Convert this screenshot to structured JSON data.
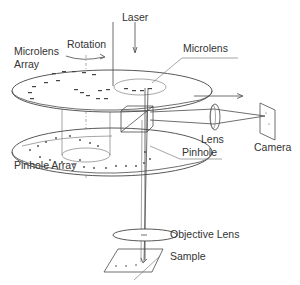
{
  "diagram": {
    "labels": {
      "laser": "Laser",
      "microlens_array": [
        "Microlens",
        "Array"
      ],
      "rotation": "Rotation",
      "microlens": "Microlens",
      "lens": "Lens",
      "pinhole": "Pinhole",
      "camera": "Camera",
      "pinhole_array": "Pinhole Array",
      "objective_lens": "Objective Lens",
      "sample": "Sample"
    },
    "components": [
      {
        "id": "laser",
        "label": "Laser",
        "type": "light-source"
      },
      {
        "id": "microlens-disk",
        "label": "Microlens Array",
        "type": "rotating-disk"
      },
      {
        "id": "beam-splitter",
        "label": "",
        "type": "dichroic-cube"
      },
      {
        "id": "pinhole-disk",
        "label": "Pinhole Array",
        "type": "rotating-disk"
      },
      {
        "id": "objective",
        "label": "Objective Lens",
        "type": "lens"
      },
      {
        "id": "sample",
        "label": "Sample",
        "type": "specimen-plane"
      },
      {
        "id": "relay-lens",
        "label": "Lens",
        "type": "lens"
      },
      {
        "id": "camera",
        "label": "Camera",
        "type": "detector"
      }
    ],
    "colors": {
      "line": "#4a4a4a",
      "text": "#333333",
      "background": "#ffffff"
    }
  }
}
